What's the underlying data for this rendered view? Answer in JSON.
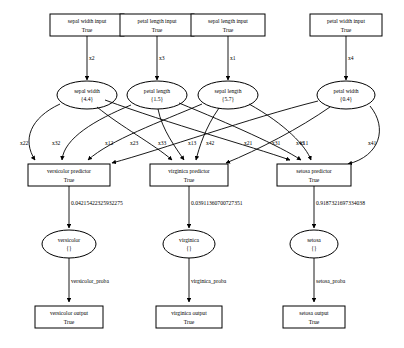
{
  "diagram": {
    "inputs": [
      {
        "id": "in-sepal-width",
        "label": "sepal width input",
        "sub": "True"
      },
      {
        "id": "in-petal-length",
        "label": "petal length input",
        "sub": "True"
      },
      {
        "id": "in-sepal-length",
        "label": "sepal length input",
        "sub": "True"
      },
      {
        "id": "in-petal-width",
        "label": "petal width input",
        "sub": "True"
      }
    ],
    "input_edges": [
      {
        "label": "x2"
      },
      {
        "label": "x3"
      },
      {
        "label": "x1"
      },
      {
        "label": "x4"
      }
    ],
    "features": [
      {
        "id": "f-sepal-width",
        "label": "sepal width",
        "value": "{4.4}"
      },
      {
        "id": "f-petal-length",
        "label": "petal length",
        "value": "{1.5}"
      },
      {
        "id": "f-sepal-length",
        "label": "sepal length",
        "value": "{5.7}"
      },
      {
        "id": "f-petal-width",
        "label": "petal width",
        "value": "{0.4}"
      }
    ],
    "weight_edges": [
      {
        "label": "x22"
      },
      {
        "label": "x32"
      },
      {
        "label": "x12"
      },
      {
        "label": "x23"
      },
      {
        "label": "x33"
      },
      {
        "label": "x13"
      },
      {
        "label": "x42"
      },
      {
        "label": "x21"
      },
      {
        "label": "x31"
      },
      {
        "label": "x11"
      },
      {
        "label": "x43"
      },
      {
        "label": "x41"
      }
    ],
    "predictors": [
      {
        "id": "p-versicolor",
        "label": "versicolor predictor",
        "sub": "True"
      },
      {
        "id": "p-virginica",
        "label": "virginica predictor",
        "sub": "True"
      },
      {
        "id": "p-setosa",
        "label": "setosa predictor",
        "sub": "True"
      }
    ],
    "probabilities": [
      {
        "label": "0.04215422325932275"
      },
      {
        "label": "0.03911360700727351"
      },
      {
        "label": "0.9187321697334038"
      }
    ],
    "classes": [
      {
        "id": "c-versicolor",
        "label": "versicolor",
        "value": "{}"
      },
      {
        "id": "c-virginica",
        "label": "virginica",
        "value": "{}"
      },
      {
        "id": "c-setosa",
        "label": "setosa",
        "value": "{}"
      }
    ],
    "proba_edges": [
      {
        "label": "versicolor_proba"
      },
      {
        "label": "virginica_proba"
      },
      {
        "label": "setosa_proba"
      }
    ],
    "outputs": [
      {
        "id": "out-versicolor",
        "label": "versicolor output",
        "sub": "True"
      },
      {
        "id": "out-virginica",
        "label": "virginica output",
        "sub": "True"
      },
      {
        "id": "out-setosa",
        "label": "setosa output",
        "sub": "True"
      }
    ],
    "colors": {
      "stroke": "#000000",
      "fill": "#ffffff",
      "background": "#ffffff"
    }
  }
}
